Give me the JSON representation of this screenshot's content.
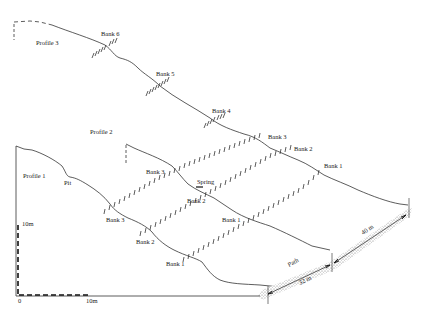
{
  "diagram": {
    "type": "landslide slope cross-section profiles",
    "profiles": [
      {
        "id": "profile-3",
        "label": "Profile 3",
        "label_pos": [
          36,
          42
        ]
      },
      {
        "id": "profile-2",
        "label": "Profile 2",
        "label_pos": [
          90,
          132
        ]
      },
      {
        "id": "profile-1",
        "label": "Profile 1",
        "label_pos": [
          23,
          176
        ]
      }
    ],
    "banks": [
      {
        "label": "Bank 6",
        "pos": [
          101,
          35
        ]
      },
      {
        "label": "Bank 5",
        "pos": [
          156,
          75
        ]
      },
      {
        "label": "Bank 4",
        "pos": [
          212,
          112
        ]
      },
      {
        "label": "Bank 3",
        "pos": [
          268,
          137
        ]
      },
      {
        "label": "Bank 2",
        "pos": [
          294,
          150
        ]
      },
      {
        "label": "Bank 1",
        "pos": [
          323,
          167
        ]
      },
      {
        "label": "Bank 3",
        "pos": [
          145,
          173
        ]
      },
      {
        "label": "Bank 2",
        "pos": [
          188,
          202
        ]
      },
      {
        "label": "Bank 1",
        "pos": [
          221,
          222
        ]
      },
      {
        "label": "Bank 3",
        "pos": [
          106,
          222
        ]
      },
      {
        "label": "Bank 2",
        "pos": [
          135,
          244
        ]
      },
      {
        "label": "Bank 1",
        "pos": [
          166,
          265
        ]
      }
    ],
    "features": {
      "pit": "Pit",
      "spring": "Spring",
      "path": "Path",
      "path_length_1": "32 m",
      "path_length_2": "40 m"
    },
    "scale": {
      "vertical": "10m",
      "horizontal": "10m",
      "origin": "0"
    }
  }
}
